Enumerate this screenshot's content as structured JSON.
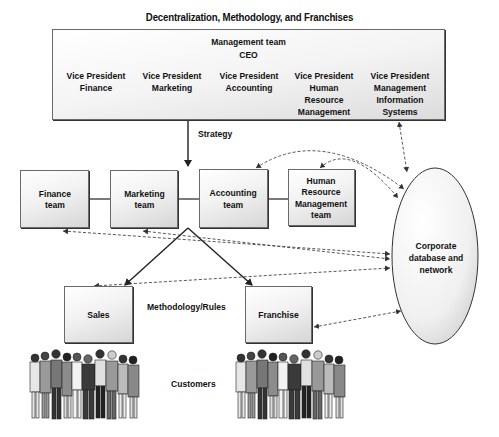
{
  "title": "Decentralization, Methodology, and Franchises",
  "management": {
    "heading": "Management team",
    "ceo": "CEO",
    "vice_presidents": [
      {
        "label": "Vice President\nFinance"
      },
      {
        "label": "Vice President\nMarketing"
      },
      {
        "label": "Vice President\nAccounting"
      },
      {
        "label": "Vice President\nHuman\nResource\nManagement"
      },
      {
        "label": "Vice President\nManagement\nInformation\nSystems"
      }
    ]
  },
  "labels": {
    "strategy": "Strategy",
    "methodology": "Methodology/Rules",
    "customers": "Customers"
  },
  "teams": [
    {
      "label": "Finance\nteam"
    },
    {
      "label": "Marketing\nteam"
    },
    {
      "label": "Accounting\nteam"
    },
    {
      "label": "Human\nResource\nManagement\nteam"
    }
  ],
  "channels": [
    {
      "label": "Sales"
    },
    {
      "label": "Franchise"
    }
  ],
  "database": {
    "label": "Corporate\ndatabase and\nnetwork"
  },
  "icons": {
    "customers_left": "people-crowd-icon",
    "customers_right": "people-crowd-icon"
  },
  "colors": {
    "line": "#222222",
    "dashed": "#444444",
    "box_border": "#6a6a6a",
    "box_fill_top": "#ffffff",
    "box_fill_bottom": "#d6d6d6"
  }
}
